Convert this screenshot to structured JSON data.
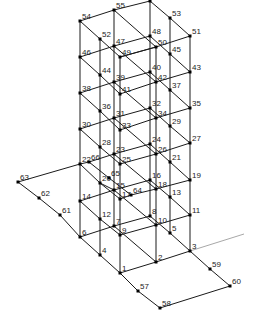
{
  "diagram": {
    "type": "3d-frame-structure-node-numbering",
    "colors": {
      "edge": "#1a1a1a",
      "faint_edge": "#a8a8a8",
      "node": "#000000",
      "label": "#222222",
      "background": "#ffffff"
    },
    "nodes": [
      {
        "id": "1",
        "x": 120,
        "y": 273
      },
      {
        "id": "2",
        "x": 156,
        "y": 262
      },
      {
        "id": "3",
        "x": 190,
        "y": 251
      },
      {
        "id": "4",
        "x": 100,
        "y": 255
      },
      {
        "id": "5",
        "x": 170,
        "y": 233
      },
      {
        "id": "6",
        "x": 80,
        "y": 237
      },
      {
        "id": "7",
        "x": 114,
        "y": 226
      },
      {
        "id": "8",
        "x": 150,
        "y": 216
      },
      {
        "id": "9",
        "x": 120,
        "y": 235
      },
      {
        "id": "10",
        "x": 156,
        "y": 225
      },
      {
        "id": "11",
        "x": 190,
        "y": 215
      },
      {
        "id": "12",
        "x": 100,
        "y": 219
      },
      {
        "id": "13",
        "x": 170,
        "y": 197
      },
      {
        "id": "14",
        "x": 80,
        "y": 201
      },
      {
        "id": "15",
        "x": 114,
        "y": 190
      },
      {
        "id": "16",
        "x": 150,
        "y": 180
      },
      {
        "id": "17",
        "x": 120,
        "y": 199
      },
      {
        "id": "18",
        "x": 156,
        "y": 189
      },
      {
        "id": "19",
        "x": 190,
        "y": 180
      },
      {
        "id": "20",
        "x": 100,
        "y": 183
      },
      {
        "id": "21",
        "x": 170,
        "y": 162
      },
      {
        "id": "22",
        "x": 80,
        "y": 164
      },
      {
        "id": "23",
        "x": 114,
        "y": 154
      },
      {
        "id": "24",
        "x": 150,
        "y": 144
      },
      {
        "id": "25",
        "x": 120,
        "y": 164
      },
      {
        "id": "26",
        "x": 156,
        "y": 154
      },
      {
        "id": "27",
        "x": 190,
        "y": 143
      },
      {
        "id": "28",
        "x": 100,
        "y": 147
      },
      {
        "id": "29",
        "x": 170,
        "y": 126
      },
      {
        "id": "30",
        "x": 80,
        "y": 129
      },
      {
        "id": "31",
        "x": 114,
        "y": 118
      },
      {
        "id": "32",
        "x": 150,
        "y": 108
      },
      {
        "id": "33",
        "x": 120,
        "y": 130
      },
      {
        "id": "34",
        "x": 156,
        "y": 118
      },
      {
        "id": "35",
        "x": 190,
        "y": 108
      },
      {
        "id": "36",
        "x": 100,
        "y": 111
      },
      {
        "id": "37",
        "x": 170,
        "y": 90
      },
      {
        "id": "38",
        "x": 80,
        "y": 93
      },
      {
        "id": "39",
        "x": 114,
        "y": 82
      },
      {
        "id": "40",
        "x": 150,
        "y": 72
      },
      {
        "id": "41",
        "x": 120,
        "y": 94
      },
      {
        "id": "42",
        "x": 156,
        "y": 82
      },
      {
        "id": "43",
        "x": 190,
        "y": 72
      },
      {
        "id": "44",
        "x": 100,
        "y": 75
      },
      {
        "id": "45",
        "x": 170,
        "y": 54
      },
      {
        "id": "46",
        "x": 80,
        "y": 57
      },
      {
        "id": "47",
        "x": 114,
        "y": 46
      },
      {
        "id": "48",
        "x": 150,
        "y": 36
      },
      {
        "id": "49",
        "x": 120,
        "y": 57
      },
      {
        "id": "50",
        "x": 156,
        "y": 47
      },
      {
        "id": "51",
        "x": 190,
        "y": 36
      },
      {
        "id": "52",
        "x": 100,
        "y": 39
      },
      {
        "id": "53",
        "x": 170,
        "y": 18
      },
      {
        "id": "54",
        "x": 80,
        "y": 21
      },
      {
        "id": "55",
        "x": 114,
        "y": 10
      },
      {
        "id": "56",
        "x": 150,
        "y": 1
      },
      {
        "id": "57",
        "x": 138,
        "y": 291
      },
      {
        "id": "58",
        "x": 160,
        "y": 308
      },
      {
        "id": "59",
        "x": 210,
        "y": 269
      },
      {
        "id": "60",
        "x": 230,
        "y": 286
      },
      {
        "id": "61",
        "x": 60,
        "y": 215
      },
      {
        "id": "62",
        "x": 39,
        "y": 198
      },
      {
        "id": "63",
        "x": 18,
        "y": 182
      },
      {
        "id": "64",
        "x": 131,
        "y": 195
      },
      {
        "id": "65",
        "x": 109,
        "y": 178
      },
      {
        "id": "66",
        "x": 89,
        "y": 162
      }
    ],
    "visible_labels": [
      {
        "text": "1"
      },
      {
        "text": "2"
      },
      {
        "text": "3"
      },
      {
        "text": "4"
      },
      {
        "text": "5"
      },
      {
        "text": "6"
      },
      {
        "text": "7"
      },
      {
        "text": "8"
      },
      {
        "text": "9"
      },
      {
        "text": "10"
      },
      {
        "text": "11"
      },
      {
        "text": "12"
      },
      {
        "text": "13"
      },
      {
        "text": "14"
      },
      {
        "text": "15"
      },
      {
        "text": "16"
      },
      {
        "text": "17"
      },
      {
        "text": "18"
      },
      {
        "text": "19"
      },
      {
        "text": "20"
      },
      {
        "text": "21"
      },
      {
        "text": "22"
      },
      {
        "text": "23"
      },
      {
        "text": "24"
      },
      {
        "text": "25"
      },
      {
        "text": "26"
      },
      {
        "text": "27"
      },
      {
        "text": "28"
      },
      {
        "text": "29"
      },
      {
        "text": "30"
      },
      {
        "text": "31"
      },
      {
        "text": "32"
      },
      {
        "text": "33"
      },
      {
        "text": "34"
      },
      {
        "text": "35"
      },
      {
        "text": "36"
      },
      {
        "text": "37"
      },
      {
        "text": "38"
      },
      {
        "text": "39"
      },
      {
        "text": "40"
      },
      {
        "text": "41"
      },
      {
        "text": "42"
      },
      {
        "text": "43"
      },
      {
        "text": "44"
      },
      {
        "text": "45"
      },
      {
        "text": "46"
      },
      {
        "text": "47"
      },
      {
        "text": "48"
      },
      {
        "text": "49"
      },
      {
        "text": "50"
      },
      {
        "text": "51"
      },
      {
        "text": "52"
      },
      {
        "text": "53"
      },
      {
        "text": "54"
      },
      {
        "text": "55"
      },
      {
        "text": "57"
      },
      {
        "text": "58"
      },
      {
        "text": "59"
      },
      {
        "text": "60"
      },
      {
        "text": "61"
      },
      {
        "text": "62"
      },
      {
        "text": "63"
      },
      {
        "text": "64"
      },
      {
        "text": "65"
      },
      {
        "text": "66"
      }
    ],
    "labels": {
      "1": "1",
      "2": "2",
      "3": "3",
      "4": "4",
      "5": "5",
      "6": "6",
      "7": "7",
      "8": "8",
      "9": "9",
      "10": "10",
      "11": "11",
      "12": "12",
      "13": "13",
      "14": "14",
      "15": "15",
      "16": "16",
      "17": "17",
      "18": "18",
      "19": "19",
      "20": "20",
      "21": "21",
      "22": "22",
      "23": "23",
      "24": "24",
      "25": "25",
      "26": "26",
      "27": "27",
      "28": "28",
      "29": "29",
      "30": "30",
      "31": "31",
      "32": "32",
      "33": "33",
      "34": "34",
      "35": "35",
      "36": "36",
      "37": "37",
      "38": "38",
      "39": "39",
      "40": "40",
      "41": "41",
      "42": "42",
      "43": "43",
      "44": "44",
      "45": "45",
      "46": "46",
      "47": "47",
      "48": "48",
      "49": "49",
      "50": "50",
      "51": "51",
      "52": "52",
      "53": "53",
      "54": "54",
      "55": "55",
      "57": "57",
      "58": "58",
      "59": "59",
      "60": "60",
      "61": "61",
      "62": "62",
      "63": "63",
      "64": "64",
      "65": "65",
      "66": "66"
    }
  }
}
